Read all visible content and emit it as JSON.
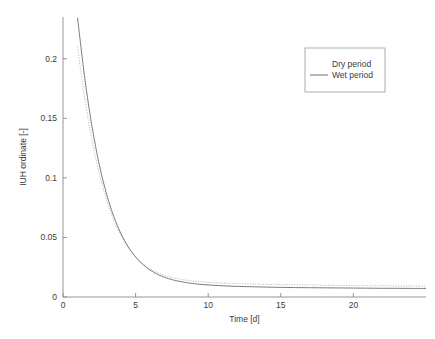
{
  "chart_data": {
    "type": "line",
    "title": "",
    "xlabel": "Time [d]",
    "ylabel": "IUH ordinate [-]",
    "xlim": [
      0,
      25
    ],
    "ylim": [
      0,
      0.235
    ],
    "xticks": [
      0,
      5,
      10,
      15,
      20
    ],
    "xtick_labels": [
      "0",
      "5",
      "10",
      "15",
      "20"
    ],
    "yticks": [
      0,
      0.05,
      0.1,
      0.15,
      0.2
    ],
    "ytick_labels": [
      "0",
      "0.05",
      "0.1",
      "0.15",
      "0.2"
    ],
    "grid": false,
    "legend_position": "upper right",
    "series": [
      {
        "name": "Dry period",
        "style": "dotted",
        "color": "#a9a9a9",
        "x": [
          1,
          1.5,
          2,
          2.5,
          3,
          3.5,
          4,
          4.5,
          5,
          5.5,
          6,
          6.5,
          7,
          7.5,
          8,
          9,
          10,
          11,
          12,
          13,
          14,
          15,
          16,
          17,
          18,
          19,
          20,
          21,
          22,
          23,
          24,
          25
        ],
        "values": [
          0.2095,
          0.1665,
          0.1315,
          0.1035,
          0.0815,
          0.0645,
          0.0515,
          0.0415,
          0.0338,
          0.0281,
          0.0238,
          0.0206,
          0.0182,
          0.0164,
          0.0151,
          0.0133,
          0.0124,
          0.0117,
          0.0113,
          0.011,
          0.0107,
          0.0105,
          0.0103,
          0.0101,
          0.0099,
          0.0098,
          0.0096,
          0.0095,
          0.0094,
          0.0093,
          0.0092,
          0.0091
        ]
      },
      {
        "name": "Wet period",
        "style": "solid",
        "color": "#6e6e6e",
        "x": [
          1,
          1.5,
          2,
          2.5,
          3,
          3.5,
          4,
          4.5,
          5,
          5.5,
          6,
          6.5,
          7,
          7.5,
          8,
          9,
          10,
          11,
          12,
          13,
          14,
          15,
          16,
          17,
          18,
          19,
          20,
          21,
          22,
          23,
          24,
          25
        ],
        "values": [
          0.2345,
          0.1835,
          0.143,
          0.111,
          0.0865,
          0.0675,
          0.053,
          0.042,
          0.0336,
          0.0273,
          0.0226,
          0.0191,
          0.0165,
          0.0146,
          0.0132,
          0.0112,
          0.0101,
          0.0094,
          0.0089,
          0.0086,
          0.0083,
          0.0081,
          0.0079,
          0.0078,
          0.0077,
          0.0076,
          0.0075,
          0.0074,
          0.0073,
          0.0073,
          0.0072,
          0.0072
        ]
      }
    ]
  },
  "legend": {
    "entries": [
      {
        "label": "Dry period"
      },
      {
        "label": "Wet period"
      }
    ]
  }
}
